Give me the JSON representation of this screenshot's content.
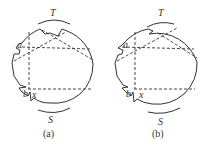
{
  "figures": [
    {
      "id": "a",
      "caption": "(a)",
      "labels": {
        "top": "T",
        "bottom": "S",
        "upper_point": "a",
        "lower_point": "b",
        "lower_var": "x"
      }
    },
    {
      "id": "b",
      "caption": "(b)",
      "labels": {
        "top": "T",
        "bottom": "S",
        "upper_point": "a",
        "lower_point": "b",
        "lower_var": "x"
      }
    }
  ],
  "colors": {
    "line": "#333333",
    "background": "#ffffff"
  }
}
